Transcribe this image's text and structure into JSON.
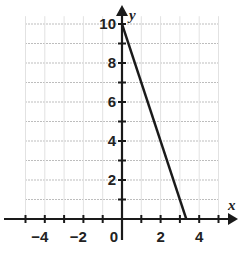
{
  "chart_data": {
    "type": "line",
    "title": "",
    "xlabel": "x",
    "ylabel": "y",
    "xlim": [
      -6,
      6
    ],
    "ylim": [
      0,
      11
    ],
    "grid": true,
    "x_tick_labels": [
      "-4",
      "-2",
      "0",
      "2",
      "4"
    ],
    "y_tick_labels": [
      "2",
      "4",
      "6",
      "8",
      "10"
    ],
    "series": [
      {
        "name": "line",
        "x": [
          0,
          3.33
        ],
        "y": [
          10,
          0
        ]
      }
    ],
    "equation_implied": "y = -3x + 10"
  },
  "colors": {
    "axis": "#1a1a1a",
    "line": "#1a1a1a",
    "grid": "#bdbdbd"
  }
}
